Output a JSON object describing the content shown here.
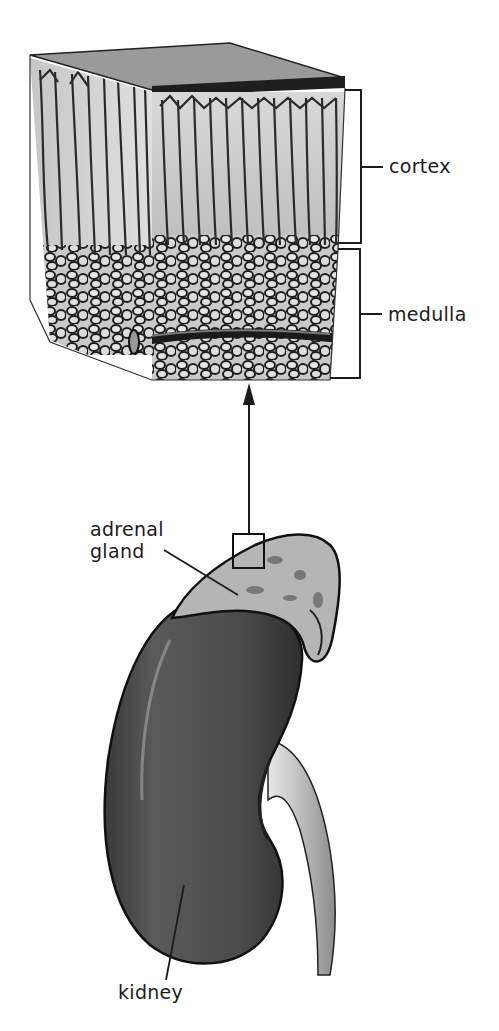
{
  "figure": {
    "type": "anatomical-illustration",
    "labels": {
      "cortex": "cortex",
      "medulla": "medulla",
      "adrenal_line1": "adrenal",
      "adrenal_line2": "gland",
      "kidney": "kidney"
    },
    "colors": {
      "background": "#ffffff",
      "ink": "#1c1c1c",
      "kidney_fill": "#4a4a4a",
      "tissue_light": "#cfcfcf",
      "adrenal_fill": "#b8b8b8"
    }
  }
}
